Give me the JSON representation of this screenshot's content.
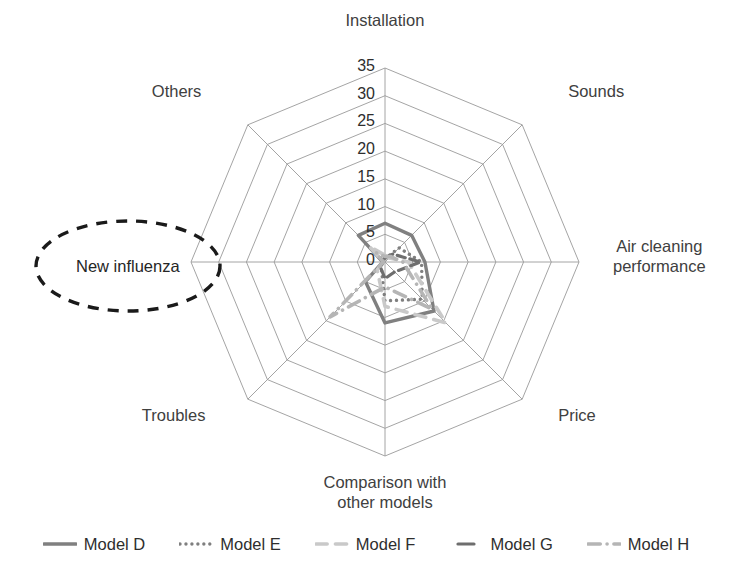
{
  "chart_data": {
    "type": "radar",
    "title": "",
    "axes": [
      "Installation",
      "Sounds",
      "Air cleaning performance",
      "Price",
      "Comparison with other models",
      "Troubles",
      "New influenza",
      "Others"
    ],
    "axis_labels_multiline": [
      [
        "Installation"
      ],
      [
        "Sounds"
      ],
      [
        "Air cleaning",
        "performance"
      ],
      [
        "Price"
      ],
      [
        "Comparison with",
        "other models"
      ],
      [
        "Troubles"
      ],
      [
        ""
      ],
      [
        "Others"
      ]
    ],
    "tick_values": [
      0,
      5,
      10,
      15,
      20,
      25,
      30,
      35
    ],
    "tick_labels": [
      "0",
      "5",
      "10",
      "15",
      "20",
      "25",
      "30",
      "35"
    ],
    "rmin": 0,
    "rmax": 35,
    "grid": true,
    "legend_position": "bottom",
    "series": [
      {
        "name": "Model D",
        "color": "#808080",
        "linestyle": "solid",
        "width": 3.4,
        "values": [
          7.0,
          6.8,
          7.2,
          12.5,
          11.0,
          5.0,
          0.4,
          6.8
        ]
      },
      {
        "name": "Model E",
        "color": "#7f7f7f",
        "linestyle": "dotted",
        "width": 3.4,
        "values": [
          0.6,
          3.6,
          6.6,
          9.5,
          7.0,
          1.0,
          0.3,
          0.6
        ]
      },
      {
        "name": "Model F",
        "color": "#c9c9c9",
        "linestyle": "dashed",
        "width": 3.6,
        "values": [
          1.2,
          1.0,
          4.2,
          15.5,
          8.0,
          2.0,
          0.3,
          4.0
        ]
      },
      {
        "name": "Model G",
        "color": "#6e6e6e",
        "linestyle": "solid-short",
        "width": 3.2,
        "values": [
          0.8,
          2.0,
          6.4,
          2.5,
          3.0,
          1.2,
          0.3,
          1.2
        ]
      },
      {
        "name": "Model H",
        "color": "#b5b5b5",
        "linestyle": "dashdot",
        "width": 3.6,
        "values": [
          1.0,
          1.4,
          3.2,
          12.0,
          4.5,
          14.0,
          0.3,
          2.4
        ]
      }
    ],
    "annotation": {
      "text": "New influenza",
      "shape": "dashed-ellipse",
      "color": "#1a1a1a"
    }
  },
  "geometry": {
    "cx": 385,
    "cy": 262,
    "max_radius": 194,
    "rings": 7,
    "start_angle_deg": -90
  },
  "legend": {
    "items": [
      {
        "label": "Model D"
      },
      {
        "label": "Model E"
      },
      {
        "label": "Model F"
      },
      {
        "label": "Model G"
      },
      {
        "label": "Model H"
      }
    ]
  }
}
